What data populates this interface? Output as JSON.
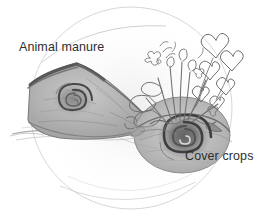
{
  "figure": {
    "kind": "pencil-sketch-diagram",
    "background_color": "#ffffff",
    "ink_color": "#6b6b6b",
    "shadow_color": "#4a4a4a",
    "label_color": "#2e2e2e",
    "width": 262,
    "height": 219
  },
  "labels": {
    "manure": "Animal manure",
    "cover_crops": "Cover crops"
  },
  "elements": {
    "boundary_circle": "faint-circle-outline",
    "left_mound": "manure-soil-wedge",
    "right_mound": "cover-crop-soil-mound",
    "left_spiral": "soil-spiral-left",
    "right_spiral": "soil-spiral-right",
    "plants": "cover-crop-plants",
    "ground_line": "ground-surface-line"
  }
}
